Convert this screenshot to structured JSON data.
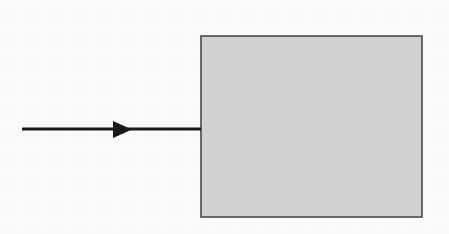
{
  "figure": {
    "kind": "block-diagram",
    "background_color": "#ffffff",
    "width": 449,
    "height": 234,
    "title": "",
    "caption": "",
    "labels": []
  },
  "block": {
    "name": "block",
    "label": "",
    "fill_color": "#d6d6d6",
    "stroke_color": "#4a4a4a",
    "stroke_width": 1.6,
    "x": 201,
    "y": 36,
    "width": 221,
    "height": 181
  },
  "arrow": {
    "name": "input-arrow",
    "label": "",
    "direction": "right",
    "stroke_color": "#1a1a1a",
    "stroke_width": 3,
    "start_x": 22,
    "end_x": 201,
    "y": 129,
    "head": {
      "base_x": 113,
      "tip_x": 132,
      "top_y": 121,
      "bottom_y": 138,
      "fill_color": "#1a1a1a"
    }
  }
}
